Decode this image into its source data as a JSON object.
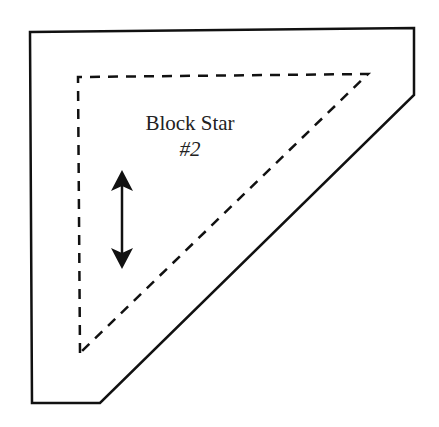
{
  "diagram": {
    "title": "Block Star",
    "subtitle": "#2",
    "stroke_color": "#111111",
    "background": "#ffffff",
    "elements": {
      "outer_cut_line": "solid polygon",
      "inner_seam_line": "dashed triangle",
      "grain_arrow": "double-headed vertical arrow"
    }
  }
}
